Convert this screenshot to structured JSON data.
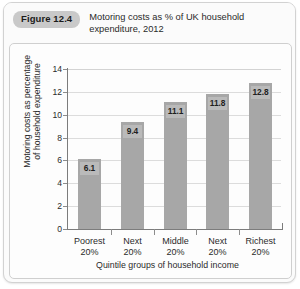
{
  "figure": {
    "badge_label": "Figure 12.4",
    "title_lines": [
      "Motoring costs as % of UK household",
      "expenditure, 2012"
    ]
  },
  "chart_data": {
    "type": "bar",
    "title": "Motoring costs as % of UK household expenditure, 2012",
    "categories": [
      "Poorest 20%",
      "Next 20%",
      "Middle 20%",
      "Next 20%",
      "Richest 20%"
    ],
    "category_lines": [
      [
        "Poorest",
        "20%"
      ],
      [
        "Next",
        "20%"
      ],
      [
        "Middle",
        "20%"
      ],
      [
        "Next",
        "20%"
      ],
      [
        "Richest",
        "20%"
      ]
    ],
    "values": [
      6.1,
      9.4,
      11.1,
      11.8,
      12.8
    ],
    "value_labels": [
      "6.1",
      "9.4",
      "11.1",
      "11.8",
      "12.8"
    ],
    "xlabel": "Quintile groups of household income",
    "ylabel": "Motoring costs as percentage of household expenditure",
    "ylabel_lines": [
      "Motoring costs as percentage",
      "of household expenditure"
    ],
    "ylim": [
      0,
      14
    ],
    "ytick_values": [
      0,
      2,
      4,
      6,
      8,
      10,
      12,
      14
    ],
    "ytick_labels": [
      "0",
      "2",
      "4",
      "6",
      "8",
      "10",
      "12",
      "14"
    ],
    "grid": true,
    "legend": null,
    "bar_color": "#a7a7a7",
    "grid_color": "#dcdcdc",
    "axis_color": "#7c7c7c"
  }
}
